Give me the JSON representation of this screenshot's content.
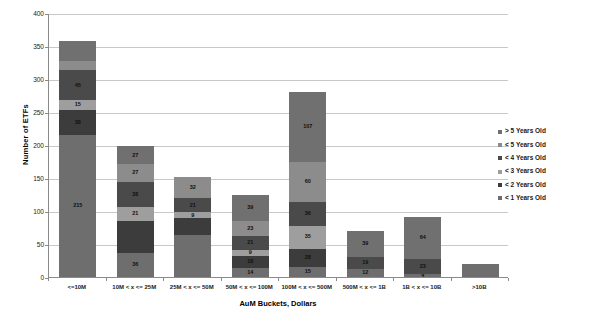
{
  "chart_data": {
    "type": "bar",
    "subtype": "stacked-bar",
    "title": "",
    "xlabel": "AuM Buckets, Dollars",
    "ylabel": "Number of ETFs",
    "ylim": [
      0,
      400
    ],
    "ytick_values": [
      0,
      50,
      100,
      150,
      200,
      250,
      300,
      350,
      400
    ],
    "ytick_labels": [
      "0",
      "50",
      "100",
      "150",
      "200",
      "250",
      "300",
      "350",
      "400"
    ],
    "grid": true,
    "legend_position": "right",
    "categories": [
      "<=10M",
      "10M < x <= 25M",
      "25M < x <= 50M",
      "50M < x <= 100M",
      "100M < x <= 500M",
      "500M < x <= 1B",
      "1B < x <= 10B",
      ">10B"
    ],
    "series": [
      {
        "name": "< 1 Years Old",
        "color": "#6e6e6e",
        "values": [
          215,
          36,
          63,
          14,
          15,
          12,
          4,
          20
        ],
        "labels": [
          "215",
          "36",
          "",
          "14",
          "15",
          "12",
          "4",
          ""
        ]
      },
      {
        "name": "< 2 Years Old",
        "color": "#3c3c3c",
        "values": [
          38,
          49,
          26,
          18,
          28,
          0,
          0,
          0
        ],
        "labels": [
          "38",
          "",
          "",
          "18",
          "28",
          "",
          "",
          ""
        ]
      },
      {
        "name": "< 3 Years Old",
        "color": "#9e9e9e",
        "values": [
          15,
          21,
          9,
          9,
          35,
          0,
          0,
          0
        ],
        "labels": [
          "15",
          "21",
          "9",
          "9",
          "35",
          "",
          "",
          ""
        ]
      },
      {
        "name": "< 4 Years Old",
        "color": "#4a4a4a",
        "values": [
          45,
          38,
          21,
          21,
          36,
          19,
          23,
          0
        ],
        "labels": [
          "45",
          "38",
          "21",
          "21",
          "36",
          "19",
          "23",
          ""
        ]
      },
      {
        "name": "< 5 Years Old",
        "color": "#8c8c8c",
        "values": [
          14,
          27,
          32,
          23,
          60,
          0,
          0,
          0
        ],
        "labels": [
          "",
          "27",
          "32",
          "23",
          "60",
          "",
          "",
          ""
        ]
      },
      {
        "name": "> 5 Years Old",
        "color": "#707070",
        "values": [
          31,
          27,
          0,
          39,
          107,
          39,
          64,
          0
        ],
        "labels": [
          "",
          "27",
          "",
          "39",
          "107",
          "39",
          "64",
          ""
        ]
      }
    ],
    "totals": [
      358,
      198,
      151,
      124,
      281,
      70,
      91,
      20
    ]
  },
  "legend": {
    "items": [
      {
        "label": "> 5 Years Old",
        "color": "#707070"
      },
      {
        "label": "< 5 Years Old",
        "color": "#8c8c8c"
      },
      {
        "label": "< 4 Years Old",
        "color": "#4a4a4a"
      },
      {
        "label": "< 3 Years Old",
        "color": "#9e9e9e"
      },
      {
        "label": "< 2 Years Old",
        "color": "#3c3c3c"
      },
      {
        "label": "< 1 Years Old",
        "color": "#6e6e6e"
      }
    ]
  },
  "axes": {
    "y_title": "Number of ETFs",
    "x_title": "AuM Buckets, Dollars"
  }
}
